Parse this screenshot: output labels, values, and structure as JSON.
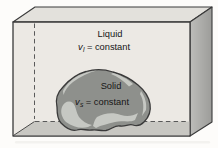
{
  "figure": {
    "labels": {
      "liquid": {
        "title": "Liquid",
        "var": "v",
        "subscript": "l",
        "equals": "= constant"
      },
      "solid": {
        "title": "Solid",
        "var": "v",
        "subscript": "s",
        "equals": "= constant"
      }
    }
  },
  "colors": {
    "background": "#fdfcfa",
    "liquid_face": "#ece9e4",
    "top_face": "#e3e1dc",
    "right_face_light": "#bdbdba",
    "right_face_dark": "#9c9c99",
    "floor": "#c8c7c2",
    "rock_base": "#8e908c",
    "rock_highlight": "#c6c8c3",
    "outline": "#3a3a3a",
    "dash_line": "#4a4a4a",
    "text": "#161616",
    "shadow_artifact": "#f3f2ef"
  }
}
